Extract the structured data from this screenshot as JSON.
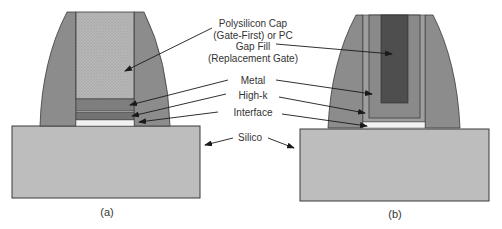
{
  "colors": {
    "background": "#ffffff",
    "spacer": "#8c8c8c",
    "polysilicon": "#b4b4b4",
    "metal": "#7e7e7e",
    "metal_b": "#8a8a8a",
    "high_k": "#737373",
    "high_k_b": "#9e9e9e",
    "interface": "#f2f2f2",
    "gap_fill": "#4e4e4e",
    "silicon": "#bdbdbd",
    "outline": "#3a3a3a",
    "arrow": "#1a1a1a"
  },
  "labels": {
    "polysilicon_line1": "Polysilicon Cap",
    "polysilicon_line2": "(Gate-First) or PC",
    "gap_fill_line1": "Gap Fill",
    "gap_fill_line2": "(Replacement Gate)",
    "metal": "Metal",
    "high_k": "High-k",
    "interface": "Interface",
    "silicon": "Silico"
  },
  "captions": {
    "a": "(a)",
    "b": "(b)"
  }
}
